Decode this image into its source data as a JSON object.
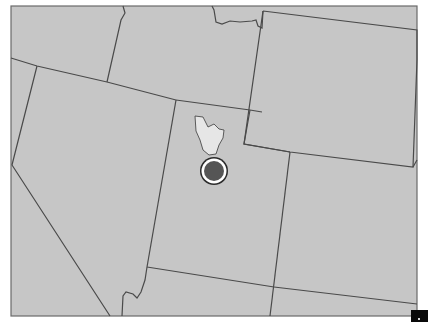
{
  "map": {
    "type": "state-boundary-map",
    "style": "grayscale",
    "colors": {
      "land": "#c6c6c6",
      "border": "#4a4a4a",
      "frame": "#6a6a6a",
      "lake": "#e6e6e6",
      "marker_fill": "#555555",
      "marker_ring": "#ffffff",
      "marker_outline": "#2a2a2a",
      "corner_square": "#0a0a0a"
    },
    "regions": [
      {
        "id": "oregon",
        "label": "Oregon"
      },
      {
        "id": "idaho",
        "label": "Idaho"
      },
      {
        "id": "montana",
        "label": "Montana"
      },
      {
        "id": "wyoming",
        "label": "Wyoming"
      },
      {
        "id": "nevada",
        "label": "Nevada"
      },
      {
        "id": "california",
        "label": "California"
      },
      {
        "id": "utah",
        "label": "Utah"
      },
      {
        "id": "colorado",
        "label": "Colorado"
      },
      {
        "id": "arizona",
        "label": "Arizona"
      },
      {
        "id": "new-mexico",
        "label": "New Mexico"
      }
    ],
    "features": {
      "lake": {
        "label": "Great Salt Lake"
      },
      "marker": {
        "label": "Location marker",
        "x": 214,
        "y": 171,
        "radius": 13
      }
    }
  }
}
